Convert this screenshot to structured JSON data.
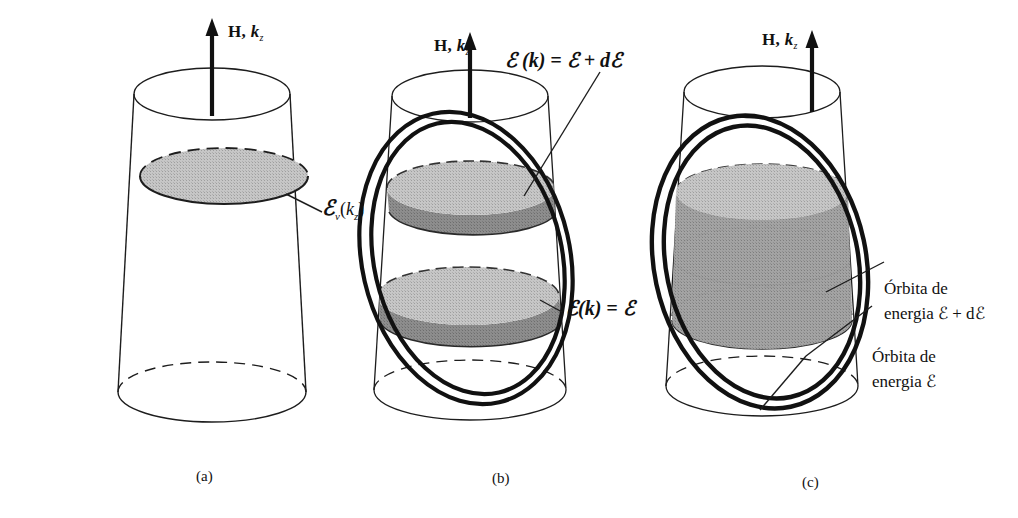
{
  "figure": {
    "background": "#ffffff",
    "ink": "#1a1a1a",
    "shade_light": "#bdbdbd",
    "shade_mid": "#9a9a9a",
    "shade_dark": "#868686",
    "panels": [
      {
        "id": "a",
        "caption": "(a)",
        "axis_label_bold": "H,",
        "axis_label_italic": "k",
        "axis_label_sub": "z",
        "annotations": [
          {
            "name": "energy-level-label",
            "parts": {
              "script": "ℰ",
              "sub": "ν",
              "arg_open": "(",
              "arg_italic": "k",
              "arg_sub": "z",
              "arg_close": ")"
            }
          }
        ]
      },
      {
        "id": "b",
        "caption": "(b)",
        "axis_label_bold": "H,",
        "axis_label_italic": "k",
        "axis_label_sub": "z",
        "annotations": [
          {
            "name": "outer-orbit-label",
            "text": "ℰ (k) = ℰ + dℰ"
          },
          {
            "name": "inner-orbit-label",
            "text": "ℰ(k) = ℰ"
          }
        ]
      },
      {
        "id": "c",
        "caption": "(c)",
        "axis_label_bold": "H,",
        "axis_label_italic": "k",
        "axis_label_sub": "z",
        "annotations": [
          {
            "name": "outer-orbit-label",
            "line1": "Órbita de",
            "line2": "energia ℰ + dℰ"
          },
          {
            "name": "inner-orbit-label",
            "line1": "Órbita de",
            "line2": "energia ℰ"
          }
        ]
      }
    ]
  }
}
